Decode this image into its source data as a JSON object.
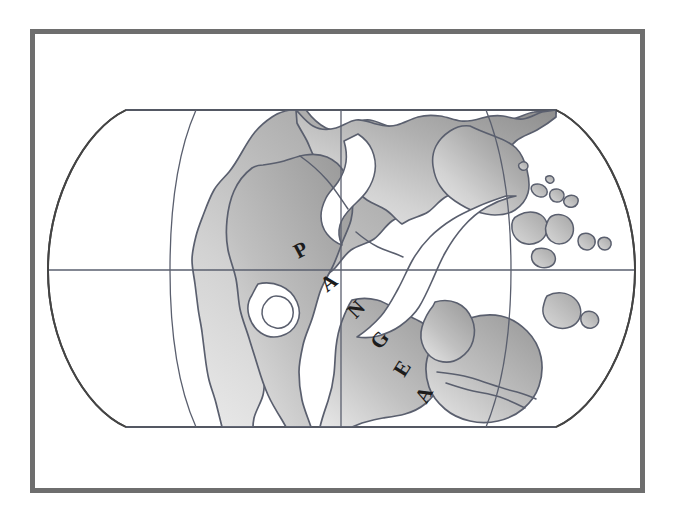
{
  "figure": {
    "kind": "map-illustration",
    "frame_color": "#6e6e6e",
    "background_color": "#ffffff",
    "land_fill_dark": "#9a9a9a",
    "land_fill_light": "#e3e3e3",
    "land_outline_color": "#5a5f6e",
    "graticule_color": "#5a5f6e",
    "globe_outline_color": "#444444",
    "label_color": "#1c1c1c"
  },
  "labels": {
    "continent": "PANGEA",
    "letters": [
      {
        "char": "P",
        "x": 304,
        "y": 256,
        "rotate": -28,
        "size": 21
      },
      {
        "char": "A",
        "x": 333,
        "y": 288,
        "rotate": -38,
        "size": 21
      },
      {
        "char": "N",
        "x": 361,
        "y": 314,
        "rotate": -46,
        "size": 21
      },
      {
        "char": "G",
        "x": 385,
        "y": 344,
        "rotate": -52,
        "size": 21
      },
      {
        "char": "E",
        "x": 408,
        "y": 372,
        "rotate": -58,
        "size": 21
      },
      {
        "char": "A",
        "x": 430,
        "y": 398,
        "rotate": -62,
        "size": 21
      }
    ]
  },
  "graticule": {
    "equator_y": 270,
    "central_meridian_x": 341,
    "top_edge_y": 110,
    "bottom_edge_y": 427,
    "left_limb_x": 48,
    "right_limb_x": 635,
    "meridians": [
      "left-30",
      "central-0",
      "right-30"
    ],
    "parallels": [
      "equator",
      "top-flat",
      "bottom-flat"
    ]
  }
}
